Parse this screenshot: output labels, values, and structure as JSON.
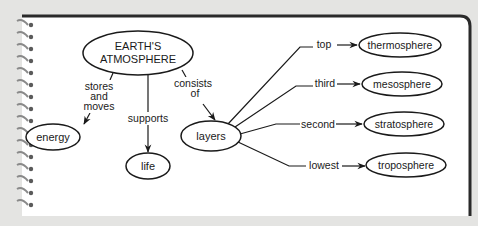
{
  "diagram": {
    "type": "concept-map",
    "colors": {
      "background": "#e4e4e2",
      "page": "#ffffff",
      "ink": "#1a1a1a",
      "page_border": "#2a2a2a",
      "spiral": "#8a8a8a"
    },
    "nodes": {
      "root": {
        "line1": "EARTH'S",
        "line2": "ATMOSPHERE"
      },
      "energy": {
        "label": "energy"
      },
      "life": {
        "label": "life"
      },
      "layers": {
        "label": "layers"
      },
      "thermosphere": {
        "label": "thermosphere"
      },
      "mesosphere": {
        "label": "mesosphere"
      },
      "stratosphere": {
        "label": "stratosphere"
      },
      "troposphere": {
        "label": "troposphere"
      }
    },
    "links": {
      "stores_moves": {
        "line1": "stores",
        "line2": "and",
        "line3": "moves"
      },
      "supports": {
        "label": "supports"
      },
      "consists_of": {
        "line1": "consists",
        "line2": "of"
      },
      "top": {
        "label": "top"
      },
      "third": {
        "label": "third"
      },
      "second": {
        "label": "second"
      },
      "lowest": {
        "label": "lowest"
      }
    }
  }
}
